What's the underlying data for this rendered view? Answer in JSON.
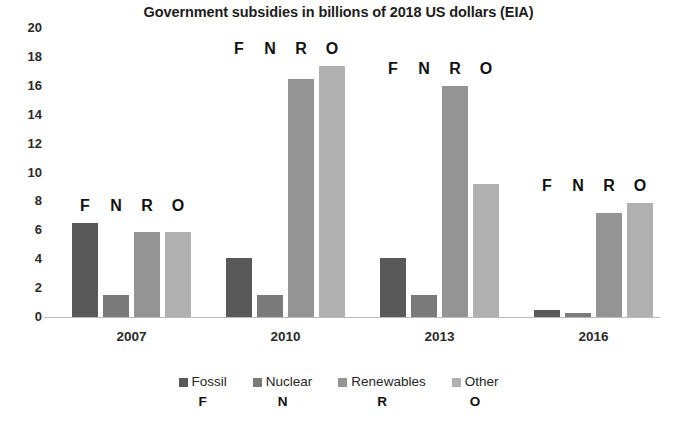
{
  "chart_data": {
    "type": "bar",
    "title": "Government subsidies in billions of 2018 US dollars (EIA)",
    "xlabel": "",
    "ylabel": "",
    "categories": [
      "2007",
      "2010",
      "2013",
      "2016"
    ],
    "series": [
      {
        "name": "Fossil",
        "key": "F",
        "color": "#595959",
        "values": [
          6.5,
          4.1,
          4.1,
          0.5
        ]
      },
      {
        "name": "Nuclear",
        "key": "N",
        "color": "#7b7b7b",
        "values": [
          1.5,
          1.5,
          1.5,
          0.3
        ]
      },
      {
        "name": "Renewables",
        "key": "R",
        "color": "#949494",
        "values": [
          5.9,
          16.5,
          16.0,
          7.2
        ]
      },
      {
        "name": "Other",
        "key": "O",
        "color": "#b0b0b0",
        "values": [
          5.9,
          17.4,
          9.2,
          7.9
        ]
      }
    ],
    "ylim": [
      0,
      20
    ],
    "ytick_step": 2,
    "yticks": [
      "20",
      "18",
      "16",
      "14",
      "12",
      "10",
      "8",
      "6",
      "4",
      "2",
      "0"
    ],
    "grid": false,
    "legend_position": "bottom",
    "bar_annotations": [
      "F",
      "N",
      "R",
      "O"
    ]
  },
  "legend": {
    "items": [
      {
        "label": "Fossil",
        "key": "F"
      },
      {
        "label": "Nuclear",
        "key": "N"
      },
      {
        "label": "Renewables",
        "key": "R"
      },
      {
        "label": "Other",
        "key": "O"
      }
    ]
  }
}
